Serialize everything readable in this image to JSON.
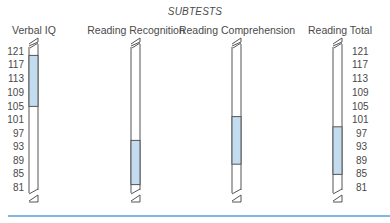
{
  "chart_data": {
    "type": "bar",
    "subtype": "floating-range",
    "title": "SUBTESTS",
    "categories": [
      "Verbal IQ",
      "Reading Recognition",
      "Reading Comprehension",
      "Reading Total"
    ],
    "series": [
      {
        "name": "range_low",
        "values": [
          105,
          82,
          88,
          85
        ]
      },
      {
        "name": "range_high",
        "values": [
          120,
          95,
          102,
          99
        ]
      }
    ],
    "ranges": [
      {
        "label": "Verbal IQ",
        "low": 105,
        "high": 120
      },
      {
        "label": "Reading Recognition",
        "low": 82,
        "high": 95
      },
      {
        "label": "Reading Comprehension",
        "low": 88,
        "high": 102
      },
      {
        "label": "Reading Total",
        "low": 85,
        "high": 99
      }
    ],
    "y_ticks": [
      121,
      117,
      113,
      109,
      105,
      101,
      97,
      93,
      89,
      85,
      81
    ],
    "ylim": [
      81,
      121
    ],
    "axis_break_marks": true,
    "grid": false,
    "legend": null,
    "colors": {
      "fill": "#c4dcf0",
      "outline": "#555555",
      "rule": "#7fb8e0"
    }
  },
  "labels": {
    "title": "SUBTESTS",
    "columns": [
      "Verbal IQ",
      "Reading Recognition",
      "Reading Comprehension",
      "Reading Total"
    ],
    "ticks_left": [
      "121",
      "117",
      "113",
      "109",
      "105",
      "101",
      "97",
      "93",
      "89",
      "85",
      "81"
    ],
    "ticks_right": [
      "121",
      "117",
      "113",
      "109",
      "105",
      "101",
      "97",
      "93",
      "89",
      "85",
      "81"
    ]
  }
}
